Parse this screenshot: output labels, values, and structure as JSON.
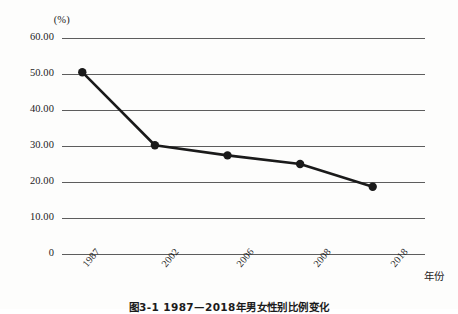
{
  "figure": {
    "caption": "图3-1 1987—2018年男女性别比例变化"
  },
  "axes": {
    "y_unit_label": "(%)",
    "y_tick_labels": [
      "60.00",
      "50.00",
      "40.00",
      "30.00",
      "20.00",
      "10.00",
      "0"
    ],
    "x_axis_title": "年份",
    "x_tick_labels": [
      "1987",
      "2002",
      "2006",
      "2008",
      "2018"
    ]
  },
  "chart_data": {
    "type": "line",
    "title": "图3-1 1987—2018年男女性别比例变化",
    "xlabel": "年份",
    "ylabel": "(%)",
    "categories": [
      "1987",
      "2002",
      "2006",
      "2008",
      "2018"
    ],
    "values": [
      50.5,
      30.2,
      27.4,
      25.0,
      18.7
    ],
    "ylim": [
      0,
      60
    ],
    "y_ticks": [
      0,
      10,
      20,
      30,
      40,
      50,
      60
    ],
    "grid": "horizontal",
    "legend": "none",
    "marker": "filled-circle",
    "line_color": "#1a1a1a",
    "grid_color": "#5d5d5d",
    "background_color": "#fdfdfc"
  }
}
